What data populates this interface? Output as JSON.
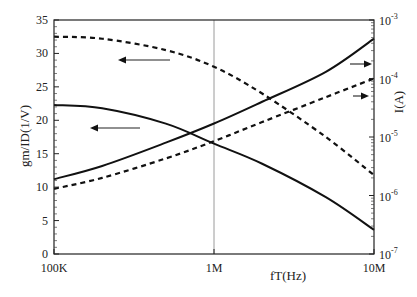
{
  "chart_data": {
    "type": "line",
    "title": "",
    "xlabel": "fT(Hz)",
    "ylabel": "gm/ID(1/V)",
    "y2label": "I(A)",
    "xscale": "log",
    "xlim": [
      100000,
      10000000
    ],
    "ylim": [
      0,
      35
    ],
    "y2scale": "log",
    "y2lim": [
      1e-07,
      0.001
    ],
    "x_ticks": [
      {
        "value": 100000,
        "label": "100K"
      },
      {
        "value": 1000000,
        "label": "1M"
      },
      {
        "value": 10000000,
        "label": "10M"
      }
    ],
    "y_ticks": [
      0,
      5,
      10,
      15,
      20,
      25,
      30,
      35
    ],
    "y2_ticks": [
      {
        "base": "10",
        "exp": "-3"
      },
      {
        "base": "10",
        "exp": "-4"
      },
      {
        "base": "10",
        "exp": "-5"
      },
      {
        "base": "10",
        "exp": "-6"
      },
      {
        "base": "10",
        "exp": "-7"
      }
    ],
    "grid": false,
    "reference_line": {
      "x": 1000000,
      "orientation": "vertical"
    },
    "x": [
      100000,
      200000,
      500000,
      1000000,
      2000000,
      5000000,
      10000000
    ],
    "series": [
      {
        "name": "gm/ID (solid)",
        "axis": "left",
        "style": "solid",
        "values": [
          22.3,
          21.8,
          19.5,
          16.5,
          13.5,
          8.5,
          3.6
        ]
      },
      {
        "name": "gm/ID (dashed)",
        "axis": "left",
        "style": "dashed",
        "values": [
          32.5,
          32.2,
          30.5,
          28.0,
          24.0,
          17.5,
          11.8
        ]
      },
      {
        "name": "I (solid)",
        "axis": "right",
        "style": "solid",
        "values": [
          1.9e-06,
          3.2e-06,
          8e-06,
          1.7e-05,
          4e-05,
          0.00013,
          0.00048
        ]
      },
      {
        "name": "I (dashed)",
        "axis": "right",
        "style": "dashed",
        "values": [
          1.3e-06,
          2e-06,
          4.3e-06,
          8.5e-06,
          1.8e-05,
          4.8e-05,
          0.0001
        ]
      }
    ],
    "annotations": [
      {
        "type": "arrow",
        "direction": "left",
        "points_to": "gm/ID (dashed)"
      },
      {
        "type": "arrow",
        "direction": "left",
        "points_to": "gm/ID (solid)"
      },
      {
        "type": "arrow",
        "direction": "right",
        "points_to": "I (solid)"
      },
      {
        "type": "arrow",
        "direction": "right",
        "points_to": "I (dashed)"
      }
    ]
  }
}
